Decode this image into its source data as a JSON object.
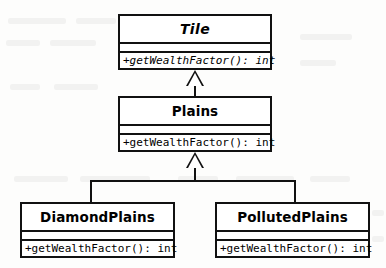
{
  "diagram": {
    "notation": "UML class diagram",
    "background_color": "#fdfdfc",
    "line_color": "#111111"
  },
  "classes": [
    {
      "id": "tile",
      "name": "Tile",
      "abstract": true,
      "attributes": [],
      "operations": [
        "+getWealthFactor(): int"
      ],
      "operation_abstract": true
    },
    {
      "id": "plains",
      "name": "Plains",
      "abstract": false,
      "attributes": [],
      "operations": [
        "+getWealthFactor(): int"
      ],
      "operation_abstract": false
    },
    {
      "id": "diamond_plains",
      "name": "DiamondPlains",
      "abstract": false,
      "attributes": [],
      "operations": [
        "+getWealthFactor(): int"
      ],
      "operation_abstract": false
    },
    {
      "id": "polluted_plains",
      "name": "PollutedPlains",
      "abstract": false,
      "attributes": [],
      "operations": [
        "+getWealthFactor(): int"
      ],
      "operation_abstract": false
    }
  ],
  "relationships": [
    {
      "type": "generalization",
      "from": "Plains",
      "to": "Tile"
    },
    {
      "type": "generalization",
      "from": "DiamondPlains",
      "to": "Plains"
    },
    {
      "type": "generalization",
      "from": "PollutedPlains",
      "to": "Plains"
    }
  ]
}
